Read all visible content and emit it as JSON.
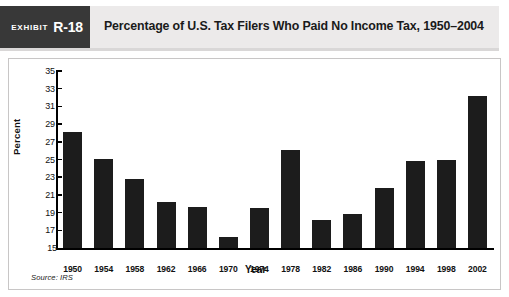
{
  "exhibit": {
    "word": "Exhibit",
    "number": "R-18"
  },
  "header": {
    "title": "Percentage of U.S. Tax Filers Who Paid No Income Tax, 1950–2004"
  },
  "source": {
    "note": "Source: IRS"
  },
  "colors": {
    "bar": "#1c1c1c",
    "tag_background": "#383838",
    "header_background": "#eceaea",
    "panel_border": "#c8c6c6"
  },
  "chart_data": {
    "type": "bar",
    "title": "Percentage of U.S. Tax Filers Who Paid No Income Tax, 1950–2004",
    "xlabel": "Year",
    "ylabel": "Percent",
    "ylim": [
      15,
      35
    ],
    "ytick_values": [
      15,
      17,
      19,
      21,
      23,
      25,
      27,
      29,
      31,
      33,
      35
    ],
    "ytick_labels": [
      "15",
      "17",
      "19",
      "21",
      "23",
      "25",
      "27",
      "29",
      "31",
      "33",
      "35"
    ],
    "grid": false,
    "legend": false,
    "categories": [
      "1950",
      "1954",
      "1958",
      "1962",
      "1966",
      "1970",
      "1974",
      "1978",
      "1982",
      "1986",
      "1990",
      "1994",
      "1998",
      "2002"
    ],
    "values": [
      28.1,
      25.1,
      22.8,
      20.2,
      19.6,
      16.2,
      19.5,
      26.1,
      18.2,
      18.9,
      21.8,
      24.8,
      25.0,
      32.2
    ]
  }
}
